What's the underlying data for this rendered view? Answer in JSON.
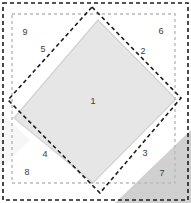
{
  "figure": {
    "width": 191,
    "height": 203,
    "background_color": "#ffffff"
  },
  "colors": {
    "outer_dashed_square_stroke": "#1c1c1c",
    "inner_dashed_square_stroke": "#b9b9b9",
    "rotated_dashed_square_stroke": "#1c1c1c",
    "diamond_fill": "#e6e6e6",
    "diamond_stroke": "#d2d2d2",
    "light_band_fill": "#f4f4f4",
    "pale_fill": "#fafafa",
    "dark_corner_fill": "#d0d0d0",
    "label_text": "#3a3a3a"
  },
  "shapes": [
    {
      "id": "outer-dashed-square",
      "name": "outer-dashed-square",
      "kind": "rectangle",
      "stroke_style": "dashed",
      "stroke_color": "#1c1c1c",
      "stroke_width": 1.6,
      "dash_pattern": "4 3",
      "fill": "none",
      "x": 3,
      "y": 3,
      "width": 185,
      "height": 197
    },
    {
      "id": "inner-dashed-square",
      "name": "inner-dashed-square",
      "kind": "rectangle",
      "stroke_style": "dashed",
      "stroke_color": "#b9b9b9",
      "stroke_width": 1.4,
      "dash_pattern": "3 3",
      "fill": "none",
      "x": 12,
      "y": 14,
      "width": 163,
      "height": 169
    },
    {
      "id": "rotated-dashed-square",
      "name": "rotated-dashed-square",
      "kind": "polygon",
      "stroke_style": "dashed",
      "stroke_color": "#1c1c1c",
      "stroke_width": 1.6,
      "dash_pattern": "4 3",
      "fill": "none",
      "points": "92,7 181,98 100,193 8,100"
    },
    {
      "id": "shaded-diamond",
      "name": "shaded-diamond",
      "kind": "polygon",
      "stroke_style": "solid",
      "stroke_color": "#d2d2d2",
      "stroke_width": 1.2,
      "fill": "#e6e6e6",
      "points": "98,20 176,99 93,183 14,118"
    },
    {
      "id": "dark-corner-wedge",
      "name": "dark-corner-wedge",
      "kind": "polygon",
      "stroke_style": "none",
      "fill": "#d0d0d0",
      "points": "191,130 191,203 115,203"
    },
    {
      "id": "pale-left-band",
      "name": "pale-left-band",
      "kind": "polygon",
      "stroke_style": "none",
      "fill": "#f6f6f6",
      "points": "0,112 30,140 0,170"
    }
  ],
  "labels": [
    {
      "id": "region-1",
      "text": "1",
      "x": 93,
      "y": 102
    },
    {
      "id": "region-2",
      "text": "2",
      "x": 143,
      "y": 52
    },
    {
      "id": "region-3",
      "text": "3",
      "x": 145,
      "y": 154
    },
    {
      "id": "region-4",
      "text": "4",
      "x": 45,
      "y": 155
    },
    {
      "id": "region-5",
      "text": "5",
      "x": 43,
      "y": 50
    },
    {
      "id": "region-6",
      "text": "6",
      "x": 161,
      "y": 32
    },
    {
      "id": "region-7",
      "text": "7",
      "x": 162,
      "y": 174
    },
    {
      "id": "region-8",
      "text": "8",
      "x": 27,
      "y": 173
    },
    {
      "id": "region-9",
      "text": "9",
      "x": 25,
      "y": 33
    }
  ]
}
